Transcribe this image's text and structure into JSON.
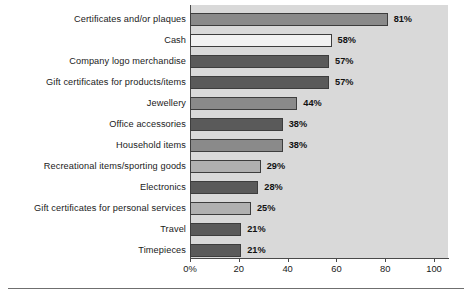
{
  "chart_data": {
    "type": "bar",
    "orientation": "horizontal",
    "title": "",
    "xlabel": "",
    "ylabel": "",
    "xlim": [
      0,
      110
    ],
    "grid": false,
    "legend": false,
    "categories": [
      "Certificates and/or plaques",
      "Cash",
      "Company logo merchandise",
      "Gift certificates for products/items",
      "Jewellery",
      "Office accessories",
      "Household items",
      "Recreational items/sporting goods",
      "Electronics",
      "Gift certificates for personal services",
      "Travel",
      "Timepieces"
    ],
    "values": [
      81,
      58,
      57,
      57,
      44,
      38,
      38,
      29,
      28,
      25,
      21,
      21
    ],
    "value_labels": [
      "81%",
      "58%",
      "57%",
      "57%",
      "44%",
      "38%",
      "38%",
      "29%",
      "28%",
      "25%",
      "21%",
      "21%"
    ],
    "bar_shades": [
      "shade-mid",
      "shade-light",
      "shade-dark",
      "shade-dark",
      "shade-mid",
      "shade-dark",
      "shade-mid",
      "shade-midlight",
      "shade-dark",
      "shade-midlight",
      "shade-dark",
      "shade-dark"
    ],
    "xticks": [
      0,
      20,
      40,
      60,
      80,
      100
    ],
    "xtick_labels": [
      "0%",
      "20",
      "40",
      "60",
      "80",
      "100"
    ]
  },
  "colors": {
    "plot_background": "#d9d9d9",
    "page_background": "#ffffff",
    "axis": "#4a4a4a",
    "text": "#1a1a1a"
  },
  "footer": {
    "source_note": ""
  }
}
